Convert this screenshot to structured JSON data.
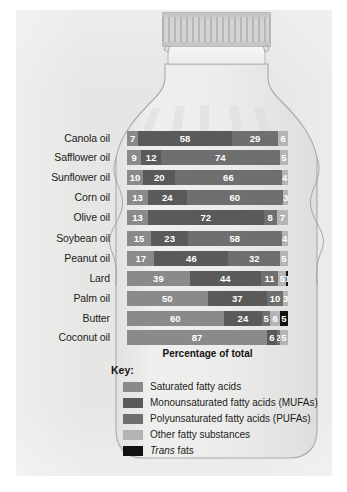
{
  "figure": {
    "illustration": "oil-bottle",
    "paper_background": "#e6e6e4"
  },
  "chart_data": {
    "type": "bar",
    "orientation": "horizontal",
    "stacked": true,
    "normalized_percent": true,
    "title": "",
    "xlabel": "Percentage of total",
    "ylabel": "",
    "xlim": [
      0,
      100
    ],
    "grid": false,
    "legend_position": "bottom-left",
    "legend_title": "Key:",
    "categories": [
      "Canola oil",
      "Safflower oil",
      "Sunflower oil",
      "Corn oil",
      "Olive oil",
      "Soybean oil",
      "Peanut oil",
      "Lard",
      "Palm oil",
      "Butter",
      "Coconut oil"
    ],
    "series": [
      {
        "name": "Saturated fatty acids",
        "key": "sat",
        "color": "#8a8a8a",
        "values": [
          7,
          9,
          10,
          13,
          13,
          15,
          17,
          39,
          50,
          60,
          87
        ]
      },
      {
        "name": "Monounsaturated fatty acids (MUFAs)",
        "key": "mufa",
        "color": "#5a5a5a",
        "values": [
          58,
          12,
          20,
          24,
          72,
          23,
          46,
          44,
          37,
          24,
          6
        ]
      },
      {
        "name": "Polyunsaturated fatty acids (PUFAs)",
        "key": "pufa",
        "color": "#6f6f6f",
        "values": [
          29,
          74,
          66,
          60,
          8,
          58,
          32,
          11,
          10,
          5,
          2
        ]
      },
      {
        "name": "Other fatty substances",
        "key": "other",
        "color": "#b4b4b4",
        "values": [
          6,
          5,
          4,
          3,
          7,
          4,
          5,
          5,
          3,
          6,
          5
        ]
      },
      {
        "name": "Trans fats",
        "key": "trans",
        "color": "#121212",
        "values": [
          0,
          0,
          0,
          0,
          0,
          0,
          0,
          1,
          0,
          5,
          0
        ]
      }
    ]
  },
  "axis": {
    "caption": "Percentage of total"
  },
  "legend": {
    "title": "Key:",
    "items": [
      {
        "label": "Saturated fatty acids",
        "swatch": "sat",
        "italic_prefix": ""
      },
      {
        "label": "Monounsaturated fatty acids (MUFAs)",
        "swatch": "mufa",
        "italic_prefix": ""
      },
      {
        "label": "Polyunsaturated fatty acids (PUFAs)",
        "swatch": "pufa",
        "italic_prefix": ""
      },
      {
        "label": "Other fatty substances",
        "swatch": "other",
        "italic_prefix": ""
      },
      {
        "label": "fats",
        "swatch": "trans",
        "italic_prefix": "Trans"
      }
    ]
  }
}
